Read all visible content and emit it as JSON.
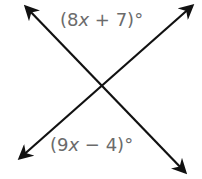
{
  "diagram": {
    "type": "intersecting-lines",
    "labels": {
      "top_angle": {
        "open": "(8",
        "var": "x",
        "rest": " + 7)°"
      },
      "bottom_angle": {
        "open": "(9",
        "var": "x",
        "rest": " − 4)°"
      }
    },
    "colors": {
      "line": "#111111",
      "label": "#6b6b6b"
    }
  }
}
